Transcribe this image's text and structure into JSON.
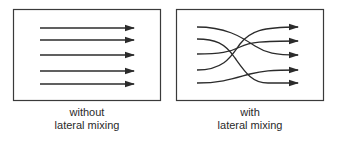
{
  "diagram": {
    "colors": {
      "stroke": "#2b2b2b",
      "box_border": "#3a3a3a",
      "background": "#ffffff"
    },
    "panels": [
      {
        "id": "without",
        "caption_line1": "without",
        "caption_line2": "lateral mixing",
        "description": "five parallel horizontal arrows",
        "lines": [
          {
            "from_y": 28,
            "to_y": 28
          },
          {
            "from_y": 40,
            "to_y": 40
          },
          {
            "from_y": 55,
            "to_y": 55
          },
          {
            "from_y": 71,
            "to_y": 71
          },
          {
            "from_y": 84,
            "to_y": 84
          }
        ]
      },
      {
        "id": "with",
        "caption_line1": "with",
        "caption_line2": "lateral mixing",
        "description": "five crossing curved arrows",
        "lines": [
          {
            "from_y": 27,
            "to_y": 55
          },
          {
            "from_y": 39,
            "to_y": 83
          },
          {
            "from_y": 54,
            "to_y": 41
          },
          {
            "from_y": 70,
            "to_y": 27
          },
          {
            "from_y": 83,
            "to_y": 70
          }
        ]
      }
    ]
  }
}
